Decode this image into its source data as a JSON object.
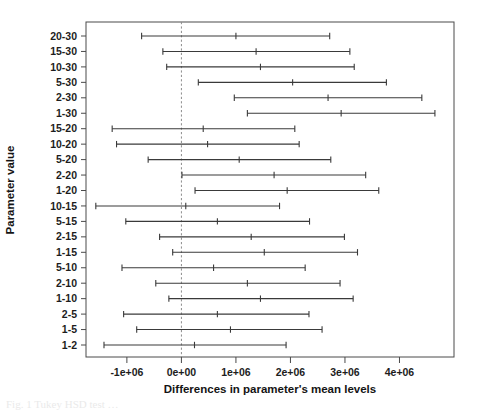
{
  "figure": {
    "background": "#ffffff",
    "line_color": "#3a3a3a",
    "axis_color": "#4a4a4a",
    "zero_line_color": "#8c8c8c",
    "caption_fragment": "Fig. 1  Tukey HSD test …"
  },
  "chart_data": {
    "type": "line",
    "plot_style": "confidence-interval-dotplot",
    "title": "",
    "xlabel": "Differences in parameter's mean levels",
    "ylabel": "Parameter value",
    "xlim": [
      -1750000,
      5000000
    ],
    "ylim_rows": 21,
    "grid": false,
    "legend": "none",
    "reference_line": {
      "x": 0,
      "style": "dashed",
      "label": "0e+00"
    },
    "xticks": [
      -1000000,
      0,
      1000000,
      2000000,
      3000000,
      4000000
    ],
    "xticklabels": [
      "-1e+06",
      "0e+00",
      "1e+06",
      "2e+06",
      "3e+06",
      "4e+06"
    ],
    "categories": [
      "20-30",
      "15-30",
      "10-30",
      "5-30",
      "2-30",
      "1-30",
      "15-20",
      "10-20",
      "5-20",
      "2-20",
      "1-20",
      "10-15",
      "5-15",
      "2-15",
      "1-15",
      "5-10",
      "2-10",
      "1-10",
      "2-5",
      "1-5",
      "1-2"
    ],
    "series": [
      {
        "name": "difference in means with 95% family-wise confidence interval",
        "points": [
          {
            "category": "20-30",
            "lower": -730000,
            "estimate": 1000000,
            "upper": 2720000
          },
          {
            "category": "15-30",
            "lower": -340000,
            "estimate": 1370000,
            "upper": 3090000
          },
          {
            "category": "10-30",
            "lower": -270000,
            "estimate": 1450000,
            "upper": 3170000
          },
          {
            "category": "5-30",
            "lower": 310000,
            "estimate": 2040000,
            "upper": 3760000
          },
          {
            "category": "2-30",
            "lower": 970000,
            "estimate": 2690000,
            "upper": 4410000
          },
          {
            "category": "1-30",
            "lower": 1210000,
            "estimate": 2930000,
            "upper": 4650000
          },
          {
            "category": "15-20",
            "lower": -1270000,
            "estimate": 400000,
            "upper": 2080000
          },
          {
            "category": "10-20",
            "lower": -1190000,
            "estimate": 480000,
            "upper": 2160000
          },
          {
            "category": "5-20",
            "lower": -610000,
            "estimate": 1060000,
            "upper": 2740000
          },
          {
            "category": "2-20",
            "lower": 10000,
            "estimate": 1700000,
            "upper": 3380000
          },
          {
            "category": "1-20",
            "lower": 250000,
            "estimate": 1940000,
            "upper": 3620000
          },
          {
            "category": "10-15",
            "lower": -1570000,
            "estimate": 80000,
            "upper": 1800000
          },
          {
            "category": "5-15",
            "lower": -1020000,
            "estimate": 660000,
            "upper": 2350000
          },
          {
            "category": "2-15",
            "lower": -400000,
            "estimate": 1280000,
            "upper": 2990000
          },
          {
            "category": "1-15",
            "lower": -160000,
            "estimate": 1520000,
            "upper": 3230000
          },
          {
            "category": "5-10",
            "lower": -1090000,
            "estimate": 590000,
            "upper": 2270000
          },
          {
            "category": "2-10",
            "lower": -470000,
            "estimate": 1210000,
            "upper": 2910000
          },
          {
            "category": "1-10",
            "lower": -230000,
            "estimate": 1450000,
            "upper": 3150000
          },
          {
            "category": "2-5",
            "lower": -1060000,
            "estimate": 660000,
            "upper": 2340000
          },
          {
            "category": "1-5",
            "lower": -820000,
            "estimate": 900000,
            "upper": 2580000
          },
          {
            "category": "1-2",
            "lower": -1420000,
            "estimate": 240000,
            "upper": 1920000
          }
        ]
      }
    ]
  }
}
